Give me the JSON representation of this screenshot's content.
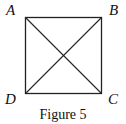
{
  "figure": {
    "caption": "Figure 5",
    "shape": "square",
    "diagonals": [
      "AC",
      "BD"
    ],
    "vertices": [
      {
        "label": "A",
        "position": "top-left"
      },
      {
        "label": "B",
        "position": "top-right"
      },
      {
        "label": "C",
        "position": "bottom-right"
      },
      {
        "label": "D",
        "position": "bottom-left"
      }
    ],
    "stroke_color": "#222222"
  }
}
